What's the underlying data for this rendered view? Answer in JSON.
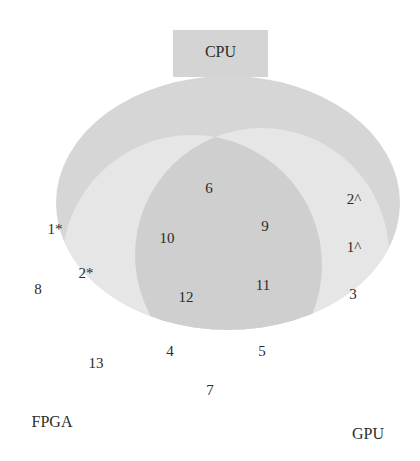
{
  "diagram": {
    "type": "venn",
    "sets": [
      {
        "name": "CPU",
        "color": "#d6d6d6"
      },
      {
        "name": "FPGA",
        "color": "#e6e6e6"
      },
      {
        "name": "GPU",
        "color": "#e6e6e6"
      }
    ],
    "overlap_color": "#cfcfcf",
    "labels": {
      "cpu": "CPU",
      "fpga": "FPGA",
      "gpu": "GPU"
    },
    "regions": {
      "r1_star": "1*",
      "r2_star": "2*",
      "r8": "8",
      "r6": "6",
      "r9": "9",
      "r10": "10",
      "r11": "11",
      "r12": "12",
      "r2_caret": "2^",
      "r1_caret": "1^",
      "r3": "3",
      "r4": "4",
      "r5": "5",
      "r7": "7",
      "r13": "13"
    }
  }
}
